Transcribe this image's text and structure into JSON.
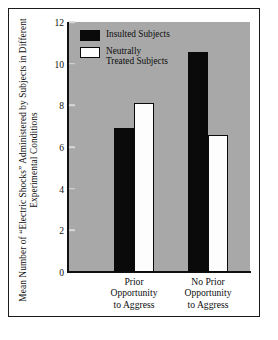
{
  "chart_data": {
    "type": "bar",
    "title": "",
    "xlabel": "",
    "ylabel": "Mean Number of “Electric Shocks” Administered by Subjects in Different Experimental Conditions",
    "categories": [
      "Prior\nOpportunity\nto Aggress",
      "No Prior\nOpportunity\nto Aggress"
    ],
    "series": [
      {
        "name": "Insulted Subjects",
        "values": [
          6.9,
          10.55
        ]
      },
      {
        "name": "Neutrally\nTreated Subjects",
        "values": [
          8.1,
          6.6
        ]
      }
    ],
    "ylim": [
      0,
      12
    ],
    "yticks": [
      0,
      2,
      4,
      6,
      8,
      10,
      12
    ],
    "ytick_labels": [
      "0",
      "2",
      "4",
      "6",
      "8",
      "10",
      "12"
    ],
    "grid": false,
    "legend_position": "top-left-inside"
  },
  "legend": {
    "entries": [
      {
        "label": "Insulted Subjects",
        "swatch": "dark"
      },
      {
        "label": "Neutrally\nTreated Subjects",
        "swatch": "light"
      }
    ]
  },
  "colors": {
    "plot_background": "#a8a8a8",
    "page_background": "#ffffff",
    "dark_bar": "#0a0a0a",
    "light_bar": "#fdfdfd",
    "axis": "#101010",
    "tick_mark": "#d8d8d8",
    "text": "#0d0d0d",
    "frame_border": "#1b1b1b"
  }
}
